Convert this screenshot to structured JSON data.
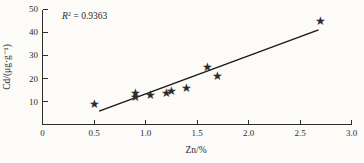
{
  "chart_data": {
    "type": "scatter",
    "title": "",
    "xlabel": "Zn/%",
    "ylabel": "Cd/(μg·g⁻¹)",
    "xlim": [
      0,
      3.0
    ],
    "ylim": [
      0,
      50
    ],
    "x_ticks": [
      0,
      0.5,
      1.0,
      1.5,
      2.0,
      2.5,
      3.0
    ],
    "x_tick_labels": [
      "0",
      "0.5",
      "1.0",
      "1.5",
      "2.0",
      "2.5",
      "3.0"
    ],
    "y_ticks": [
      10,
      20,
      30,
      40,
      50
    ],
    "y_tick_labels": [
      "10",
      "20",
      "30",
      "40",
      "50"
    ],
    "grid": false,
    "legend": "none",
    "marker": "star",
    "annotation": {
      "text": "R² = 0.9363",
      "symbol": "R",
      "superscript": "2",
      "rest": " = 0.9363"
    },
    "points": [
      {
        "x": 0.5,
        "y": 9
      },
      {
        "x": 0.9,
        "y": 14
      },
      {
        "x": 0.9,
        "y": 12
      },
      {
        "x": 1.05,
        "y": 13
      },
      {
        "x": 1.2,
        "y": 14
      },
      {
        "x": 1.25,
        "y": 14.5
      },
      {
        "x": 1.4,
        "y": 16
      },
      {
        "x": 1.6,
        "y": 25
      },
      {
        "x": 1.7,
        "y": 21
      },
      {
        "x": 2.7,
        "y": 45
      }
    ],
    "trendline": {
      "x1": 0.55,
      "y1": 6,
      "x2": 2.68,
      "y2": 41
    },
    "colors": {
      "marker": "#141414",
      "line": "#1a1a1a",
      "axis": "#2e2e2e",
      "text": "#2b2b2b",
      "background": "#fcfbf8"
    }
  }
}
